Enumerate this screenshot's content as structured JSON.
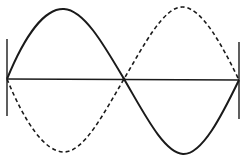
{
  "diagram": {
    "title": "",
    "colors": {
      "stroke": "#1a1a1a",
      "background": "#ffffff"
    },
    "elements": {
      "axis_line": "equilibrium line",
      "left_wall": "fixed end",
      "right_wall": "fixed end",
      "solid_wave": "wave at one extreme",
      "dashed_wave": "wave at opposite extreme",
      "center_node": "node"
    }
  }
}
